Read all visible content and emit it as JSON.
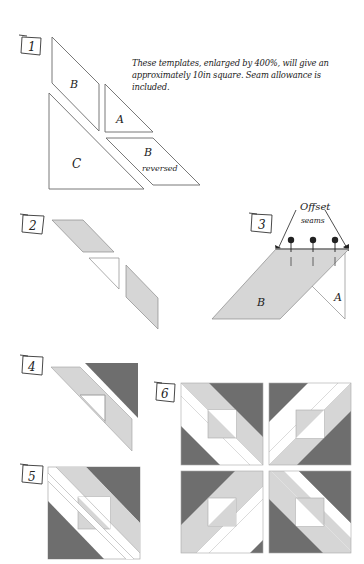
{
  "colors": {
    "outline": "#6a6a6a",
    "light_fill": "#d6d6d6",
    "dark_fill": "#6e6e6e",
    "white_fill": "#ffffff",
    "ink": "#222222"
  },
  "steps": [
    {
      "number": "1",
      "label": "step-1"
    },
    {
      "number": "2",
      "label": "step-2"
    },
    {
      "number": "3",
      "label": "step-3"
    },
    {
      "number": "4",
      "label": "step-4"
    },
    {
      "number": "5",
      "label": "step-5"
    },
    {
      "number": "6",
      "label": "step-6"
    }
  ],
  "step1": {
    "note": "These templates, enlarged by 400%, will give an approximately 10in square. Seam allowance is included.",
    "templates": {
      "b": "B",
      "a": "A",
      "c": "C",
      "b_reversed_letter": "B",
      "b_reversed_word": "reversed"
    }
  },
  "step3": {
    "callout_line1": "Offset",
    "callout_line2": "seams",
    "piece_b": "B",
    "piece_a": "A"
  }
}
